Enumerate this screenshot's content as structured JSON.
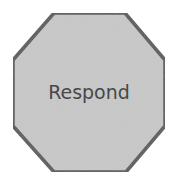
{
  "diagram": {
    "shape": "octagon",
    "label": "Respond",
    "colors": {
      "fill": "#c9c9c9",
      "stroke": "#565656",
      "text": "#474747",
      "background": "#ffffff"
    },
    "points": "54,13 125,13 165,60 165,126 126,172 54,172 13,126 13,60"
  }
}
